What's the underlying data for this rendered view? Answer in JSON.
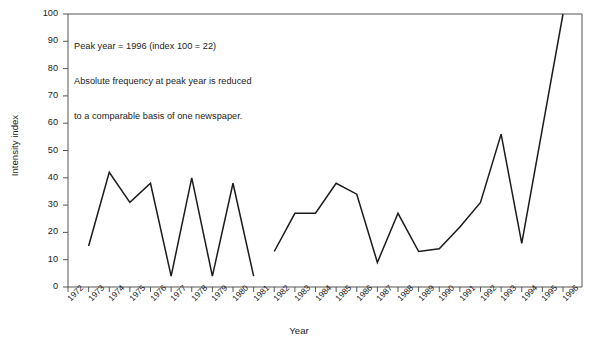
{
  "chart_data": {
    "type": "line",
    "title": "",
    "xlabel": "Year",
    "ylabel": "Intensity index",
    "xlim": [
      1972,
      1996
    ],
    "ylim": [
      0,
      100
    ],
    "grid": false,
    "legend": null,
    "y_ticks": [
      0,
      10,
      20,
      30,
      40,
      50,
      60,
      70,
      80,
      90,
      100
    ],
    "x_ticks": [
      1972,
      1973,
      1974,
      1975,
      1976,
      1977,
      1978,
      1979,
      1980,
      1981,
      1982,
      1983,
      1984,
      1985,
      1986,
      1987,
      1988,
      1989,
      1990,
      1991,
      1992,
      1993,
      1994,
      1995,
      1996
    ],
    "line_color": "#1b1b1b",
    "annotations": [
      "Peak year = 1996 (index 100 = 22)",
      "Absolute frequency at peak year is reduced",
      "to a comparable basis of one newspaper."
    ],
    "series": [
      {
        "name": "Intensity index",
        "segments": [
          {
            "x": [
              1973,
              1974,
              1975,
              1976,
              1977,
              1978,
              1979,
              1980,
              1981
            ],
            "values": [
              15,
              42,
              31,
              38,
              4,
              40,
              4,
              38,
              4
            ]
          },
          {
            "x": [
              1982,
              1983,
              1984,
              1985,
              1986,
              1987,
              1988,
              1989,
              1990,
              1991,
              1992,
              1993,
              1994,
              1995,
              1996
            ],
            "values": [
              13,
              27,
              27,
              38,
              34,
              9,
              27,
              13,
              14,
              22,
              31,
              56,
              16,
              58,
              100
            ]
          }
        ]
      }
    ]
  }
}
